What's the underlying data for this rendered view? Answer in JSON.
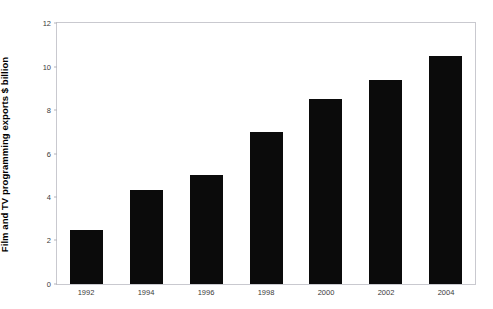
{
  "figure": {
    "top_caption_fragment": "· · ·"
  },
  "chart_data": {
    "type": "bar",
    "title": "",
    "subtitle": "",
    "xlabel": "",
    "ylabel": "Film and TV programming exports $ billion",
    "categories": [
      "1992",
      "1994",
      "1996",
      "1998",
      "2000",
      "2002",
      "2004"
    ],
    "values": [
      2.5,
      4.3,
      5.0,
      7.0,
      8.5,
      9.4,
      10.5
    ],
    "series": [
      {
        "name": "Film and TV programming exports",
        "values": [
          2.5,
          4.3,
          5.0,
          7.0,
          8.5,
          9.4,
          10.5
        ]
      }
    ],
    "ylim": [
      0,
      12
    ],
    "ytick_values": [
      0,
      2,
      4,
      6,
      8,
      10,
      12
    ],
    "ytick_labels": [
      "0",
      "2",
      "4",
      "6",
      "8",
      "10",
      "12"
    ],
    "xtick_labels": [
      "1992",
      "1994",
      "1996",
      "1998",
      "2000",
      "2002",
      "2004"
    ],
    "grid": false,
    "legend": false,
    "legend_position": "none",
    "bar_color": "#0b0b0b",
    "plot_background": "#ffffff",
    "frame_color": "#c9c9cf",
    "annotations": []
  }
}
